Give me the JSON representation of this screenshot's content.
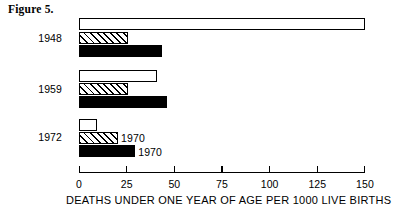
{
  "figure": {
    "caption": "Figure 5."
  },
  "chart_data": {
    "type": "bar",
    "orientation": "horizontal",
    "title": "Figure 5.",
    "xlabel": "DEATHS UNDER ONE YEAR OF AGE PER 1000 LIVE BIRTHS",
    "ylabel": "",
    "xlim": [
      0,
      150
    ],
    "xticks": [
      0,
      25,
      50,
      75,
      100,
      125,
      150
    ],
    "xtick_labels": [
      "0",
      "25",
      "50",
      "75",
      "100",
      "125",
      "150"
    ],
    "grid": false,
    "legend": "none",
    "categories": [
      "1948",
      "1959",
      "1972"
    ],
    "series": [
      {
        "name": "white-bar",
        "style": "open",
        "values": [
          150,
          41,
          9.5
        ]
      },
      {
        "name": "hatched-bar",
        "style": "diagonal-hatch",
        "values": [
          25.5,
          25.5,
          20.5
        ]
      },
      {
        "name": "solid-bar",
        "style": "solid-black",
        "values": [
          43.5,
          46,
          29.5
        ]
      }
    ],
    "annotations": [
      {
        "text": "1970",
        "attached_to": "1972 hatched-bar"
      },
      {
        "text": "1970",
        "attached_to": "1972 solid-bar"
      }
    ]
  }
}
